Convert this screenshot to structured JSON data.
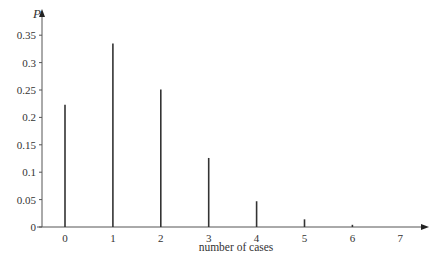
{
  "chart_data": {
    "type": "bar",
    "style": "stick/spike plot (vertical line per category)",
    "title": "",
    "xlabel": "number of cases",
    "ylabel": "P",
    "categories": [
      "0",
      "1",
      "2",
      "3",
      "4",
      "5",
      "6",
      "7"
    ],
    "values": [
      0.223,
      0.335,
      0.251,
      0.126,
      0.047,
      0.014,
      0.004,
      0.001
    ],
    "yticks": [
      "0",
      "0.05",
      "0.1",
      "0.15",
      "0.2",
      "0.25",
      "0.3",
      "0.35"
    ],
    "ytick_values": [
      0,
      0.05,
      0.1,
      0.15,
      0.2,
      0.25,
      0.3,
      0.35
    ],
    "xticks": [
      "0",
      "1",
      "2",
      "3",
      "4",
      "5",
      "6",
      "7"
    ],
    "ylim": [
      0,
      0.37
    ],
    "xlim": [
      -0.5,
      7.6
    ],
    "grid": false,
    "legend": "none",
    "colors": {
      "bars": "#333333",
      "axes": "#555555",
      "text": "#333333"
    }
  }
}
